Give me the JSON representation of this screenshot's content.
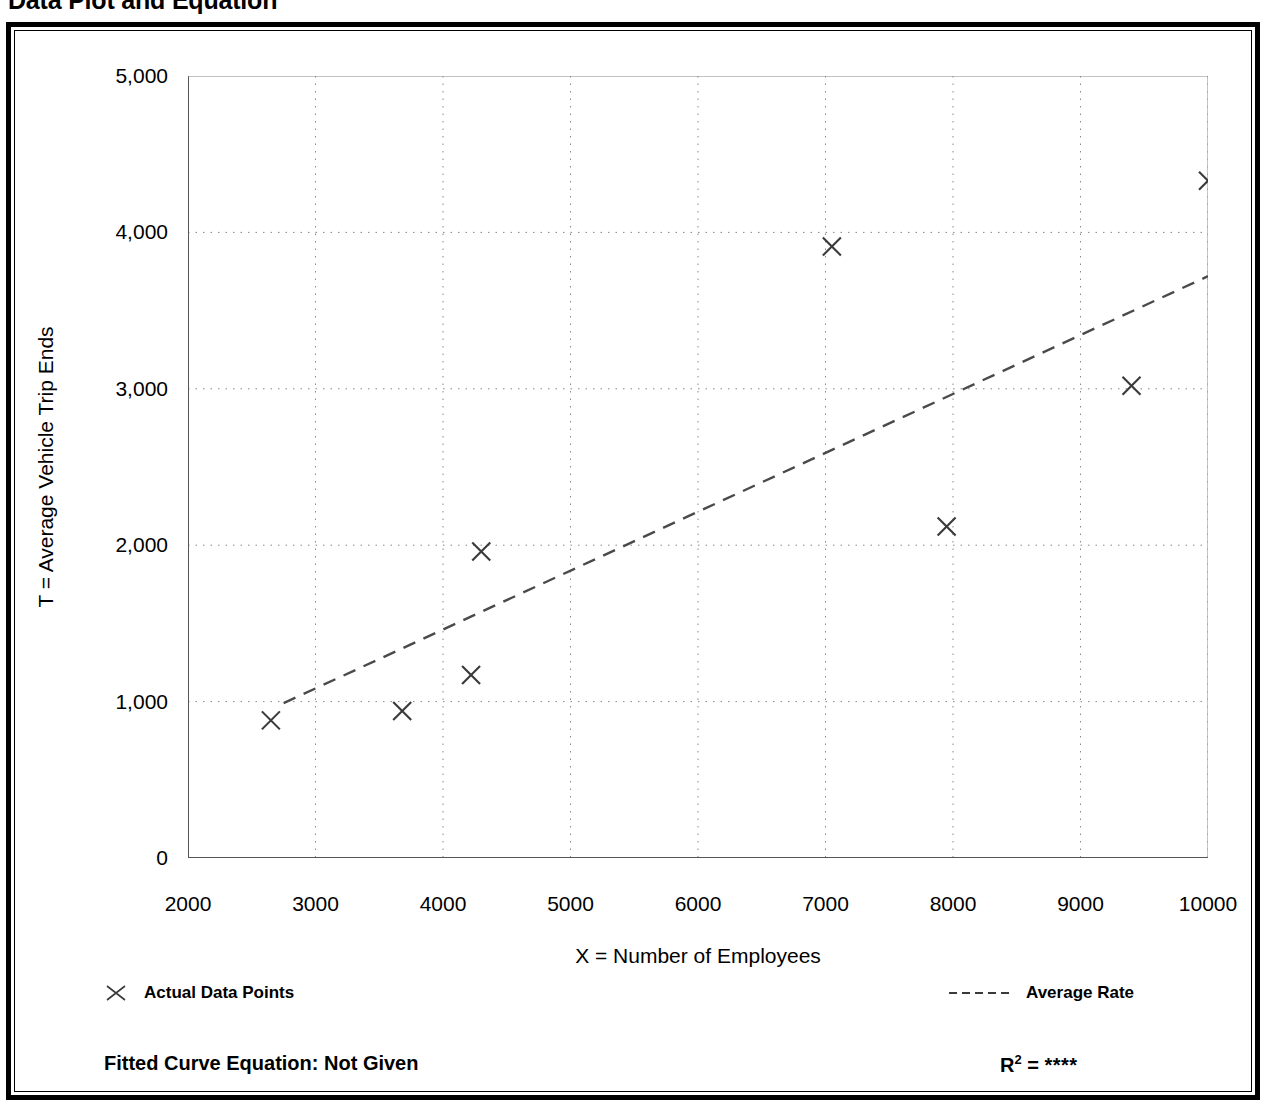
{
  "page": {
    "title": "Data Plot and Equation"
  },
  "axis": {
    "ylabel": "T = Average Vehicle Trip Ends",
    "xlabel": "X = Number of Employees"
  },
  "legend": {
    "points_label": "Actual Data Points",
    "rate_label": "Average Rate",
    "points_marker": "x-marker-icon",
    "rate_marker": "dashed-line-icon"
  },
  "footer": {
    "equation_label": "Fitted Curve Equation:",
    "equation_value": "Not Given",
    "equation_full": "Fitted Curve Equation:  Not Given",
    "r2_label": "R",
    "r2_exponent": "2",
    "r2_equals": "=",
    "r2_value": "****"
  },
  "colors": {
    "ink": "#000000",
    "axis": "#555555",
    "grid": "#888888",
    "marker": "#3a3a3a",
    "trend": "#4a4a4a",
    "frame": "#000000"
  },
  "chart_data": {
    "type": "scatter",
    "title": "Data Plot and Equation",
    "xlabel": "X = Number of Employees",
    "ylabel": "T = Average Vehicle Trip Ends",
    "xlim": [
      2000,
      10000
    ],
    "ylim": [
      0,
      5000
    ],
    "xticks": [
      2000,
      3000,
      4000,
      5000,
      6000,
      7000,
      8000,
      9000,
      10000
    ],
    "xtick_labels": [
      "2000",
      "3000",
      "4000",
      "5000",
      "6000",
      "7000",
      "8000",
      "9000",
      "10000"
    ],
    "yticks": [
      0,
      1000,
      2000,
      3000,
      4000,
      5000
    ],
    "ytick_labels": [
      "0",
      "1,000",
      "2,000",
      "3,000",
      "4,000",
      "5,000"
    ],
    "minor_tick_step_x": 500,
    "minor_tick_step_y": 500,
    "grid": true,
    "grid_style": "dotted",
    "legend_position": "below-plot",
    "series": [
      {
        "name": "Actual Data Points",
        "type": "scatter",
        "marker": "x",
        "points": [
          {
            "x": 2650,
            "y": 880
          },
          {
            "x": 3680,
            "y": 940
          },
          {
            "x": 4220,
            "y": 1170
          },
          {
            "x": 4300,
            "y": 1960
          },
          {
            "x": 7050,
            "y": 3910
          },
          {
            "x": 7950,
            "y": 2120
          },
          {
            "x": 9400,
            "y": 3020
          },
          {
            "x": 10000,
            "y": 4330
          }
        ]
      },
      {
        "name": "Average Rate",
        "type": "line",
        "style": "dashed",
        "points": [
          {
            "x": 2750,
            "y": 990
          },
          {
            "x": 10000,
            "y": 3720
          }
        ]
      }
    ],
    "annotations": [
      {
        "text": "Fitted Curve Equation:  Not Given",
        "position": "bottom-left"
      },
      {
        "text": "R2 = ****",
        "position": "bottom-right"
      }
    ]
  }
}
